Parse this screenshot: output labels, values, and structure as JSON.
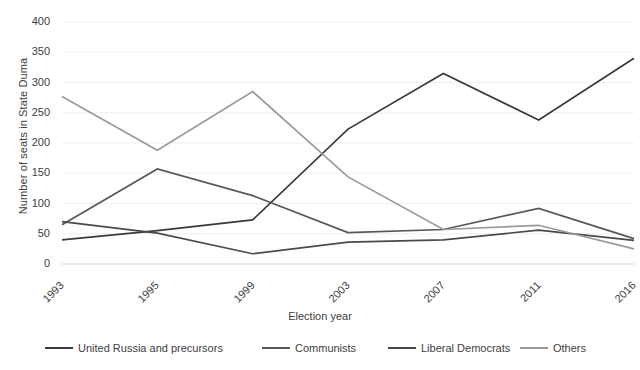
{
  "chart_data": {
    "type": "line",
    "title": "",
    "xlabel": "Election year",
    "ylabel": "Number of seats in State Duma",
    "categories": [
      "1993",
      "1995",
      "1999",
      "2003",
      "2007",
      "2011",
      "2016"
    ],
    "ylim": [
      0,
      400
    ],
    "ytick_labels": [
      "0",
      "50",
      "100",
      "150",
      "200",
      "250",
      "300",
      "350",
      "400"
    ],
    "ytick_values": [
      0,
      50,
      100,
      150,
      200,
      250,
      300,
      350,
      400
    ],
    "grid": "horizontal",
    "legend_position": "bottom",
    "series": [
      {
        "name": "United Russia and precursors",
        "color": "#3a3a3a",
        "values": [
          40,
          55,
          73,
          223,
          315,
          238,
          340
        ]
      },
      {
        "name": "Communists",
        "color": "#585858",
        "values": [
          65,
          157,
          113,
          52,
          57,
          92,
          42
        ]
      },
      {
        "name": "Liberal Democrats",
        "color": "#4a4a4a",
        "values": [
          70,
          51,
          17,
          36,
          40,
          56,
          39
        ]
      },
      {
        "name": "Others",
        "color": "#9a9a9a",
        "values": [
          277,
          188,
          285,
          144,
          57,
          64,
          25
        ]
      }
    ]
  },
  "legend": {
    "items": [
      {
        "label": "United Russia and precursors",
        "color": "#3a3a3a"
      },
      {
        "label": "Communists",
        "color": "#585858"
      },
      {
        "label": "Liberal Democrats",
        "color": "#4a4a4a"
      },
      {
        "label": "Others",
        "color": "#9a9a9a"
      }
    ]
  },
  "style": {
    "gridline_color": "#efefef",
    "axis_color": "#d9d9d9",
    "text_color": "#404040",
    "background": "#ffffff"
  }
}
